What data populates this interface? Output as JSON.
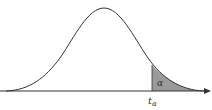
{
  "diagram": {
    "type": "t-distribution-density-curve",
    "shaded_region": "right-tail",
    "area_label": "α",
    "critical_value_label": "t",
    "critical_value_subscript": "α",
    "colors": {
      "curve": "#333333",
      "axis": "#333333",
      "shade": "#9a9a9a"
    }
  }
}
